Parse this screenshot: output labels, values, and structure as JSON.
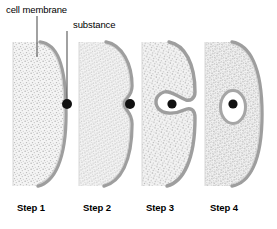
{
  "figure": {
    "width": 277,
    "height": 229,
    "background": "#ffffff"
  },
  "callouts": [
    {
      "id": "cell-membrane",
      "label": "cell membrane",
      "leader": {
        "x": 37,
        "y1": 16,
        "x2": 37,
        "y2": 56
      }
    },
    {
      "id": "substance",
      "label": "substance",
      "leader": {
        "x": 67,
        "y1": 31,
        "x2": 67,
        "y2": 99
      }
    }
  ],
  "steps": [
    {
      "id": "step-1",
      "label": "Step 1",
      "caption_x": 17
    },
    {
      "id": "step-2",
      "label": "Step 2",
      "caption_x": 83
    },
    {
      "id": "step-3",
      "label": "Step 3",
      "caption_x": 146
    },
    {
      "id": "step-4",
      "label": "Step 4",
      "caption_x": 210
    }
  ],
  "colors": {
    "membrane": "#9a9a9a",
    "membrane_shadow": "#b5b5b5",
    "cytoplasm": "#f2f2f2",
    "stipple": "#b8b8b8",
    "particle": "#111111",
    "vesicle_lumen": "#ffffff",
    "text": "#000000",
    "leader_line": "#555555"
  },
  "geometry": {
    "cell_top": 42,
    "cell_bottom": 186,
    "cells": [
      {
        "id": "cell-1",
        "left_edge": 13,
        "right_extent": 68,
        "state": "flat-membrane"
      },
      {
        "id": "cell-2",
        "left_edge": 79,
        "right_extent": 134,
        "state": "membrane-indenting"
      },
      {
        "id": "cell-3",
        "left_edge": 142,
        "right_extent": 197,
        "state": "pocket-closing"
      },
      {
        "id": "cell-4",
        "left_edge": 205,
        "right_extent": 265,
        "state": "vesicle-formed"
      }
    ],
    "particles": [
      {
        "id": "particle-1",
        "cx": 67,
        "cy": 104,
        "r": 5.0
      },
      {
        "id": "particle-2",
        "cx": 130,
        "cy": 104,
        "r": 5.0
      },
      {
        "id": "particle-3",
        "cx": 172,
        "cy": 104,
        "r": 4.6
      },
      {
        "id": "particle-4",
        "cx": 233,
        "cy": 104,
        "r": 4.6
      }
    ],
    "vesicle": {
      "cx": 233,
      "cy": 107,
      "rx": 11,
      "ry": 15
    }
  }
}
